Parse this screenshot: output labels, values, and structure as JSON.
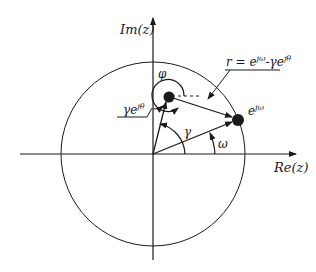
{
  "diagram": {
    "type": "z-plane unit circle diagram",
    "labels": {
      "imag_axis": "Im(z)",
      "real_axis": "Re(z)",
      "phi": "φ",
      "gamma": "γ",
      "omega": "ω",
      "pole": "γe",
      "pole_sup": "jθ",
      "point": "e",
      "point_sup": "jω",
      "r_eq": "r = e",
      "r_sup1": "jω",
      "r_mid": "-γe",
      "r_sup2": "jθ"
    },
    "colors": {
      "stroke": "#1a1a1a",
      "background": "#ffffff"
    }
  }
}
